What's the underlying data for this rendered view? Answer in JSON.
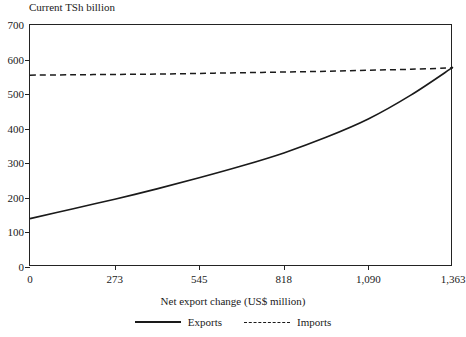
{
  "chart_data": {
    "type": "line",
    "title": "Current TSh billion",
    "xlabel": "Net export change (US$ million)",
    "ylabel": "Current TSh billion",
    "xlim": [
      0,
      1363
    ],
    "ylim": [
      0,
      700
    ],
    "grid": false,
    "legend_position": "bottom",
    "x_ticks": [
      0,
      273,
      545,
      818,
      1090,
      1363
    ],
    "x_tick_labels": [
      "0",
      "273",
      "545",
      "818",
      "1,090",
      "1,363"
    ],
    "y_ticks": [
      0,
      100,
      200,
      300,
      400,
      500,
      600,
      700
    ],
    "y_tick_labels": [
      "0",
      "100",
      "200",
      "300",
      "400",
      "500",
      "600",
      "700"
    ],
    "x": [
      0,
      136,
      273,
      409,
      545,
      681,
      818,
      954,
      1090,
      1227,
      1363
    ],
    "series": [
      {
        "name": "Exports",
        "style": "solid",
        "color": "#1a1a1a",
        "values": [
          140,
          168,
          196,
          226,
          258,
          292,
          330,
          375,
          428,
          497,
          578
        ]
      },
      {
        "name": "Imports",
        "style": "dashed",
        "color": "#1a1a1a",
        "values": [
          555,
          556,
          557,
          558,
          560,
          562,
          564,
          566,
          569,
          572,
          576
        ]
      }
    ]
  }
}
